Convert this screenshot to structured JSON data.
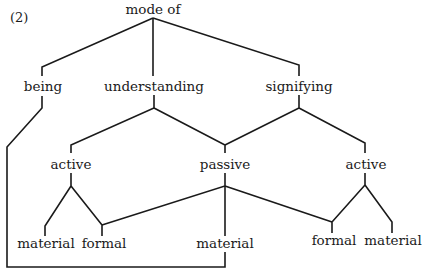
{
  "figure_label": "(2)",
  "nodes": {
    "root": "mode of",
    "being": "being",
    "understanding": "understanding",
    "signifying": "signifying",
    "active_left": "active",
    "passive": "passive",
    "active_right": "active",
    "material_left": "material",
    "formal_left": "formal",
    "material_mid": "material",
    "formal_right": "formal",
    "material_right": "material"
  },
  "edges": [
    [
      "root",
      "being"
    ],
    [
      "root",
      "understanding"
    ],
    [
      "root",
      "signifying"
    ],
    [
      "understanding",
      "active_left"
    ],
    [
      "understanding",
      "passive"
    ],
    [
      "signifying",
      "passive"
    ],
    [
      "signifying",
      "active_right"
    ],
    [
      "active_left",
      "material_left"
    ],
    [
      "active_left",
      "formal_left"
    ],
    [
      "passive",
      "formal_left"
    ],
    [
      "passive",
      "material_mid"
    ],
    [
      "passive",
      "formal_right"
    ],
    [
      "active_right",
      "formal_right"
    ],
    [
      "active_right",
      "material_right"
    ],
    [
      "being",
      "material_mid"
    ]
  ]
}
